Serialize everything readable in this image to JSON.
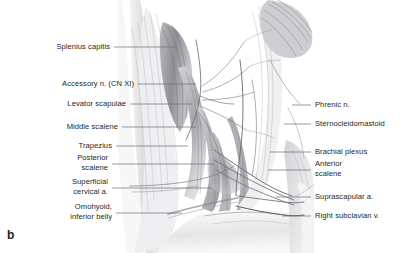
{
  "figure": {
    "marker": "b",
    "caption_text": "",
    "illustration": "grayscale-anatomical-drawing-lateral-cervical-region",
    "colors": {
      "background": "#ffffff",
      "text": "#231f20",
      "leader_line": "#6e6e72",
      "art_mid_gray": "#9a9a9e",
      "art_dark_gray": "#54545a",
      "art_light_gray": "#d5d5d8"
    }
  },
  "labels": {
    "left": [
      {
        "id": "splenius-capitis",
        "lines": [
          "Splenius capitis"
        ],
        "x": 110,
        "y": 42,
        "leader_from_x": 114,
        "leader_y": 47,
        "leader_to_x": 177
      },
      {
        "id": "accessory-nerve",
        "lines": [
          "Accessory n. (CN XI)"
        ],
        "x": 134,
        "y": 79,
        "leader_from_x": 138,
        "leader_y": 84,
        "leader_to_x": 196
      },
      {
        "id": "levator-scapulae",
        "lines": [
          "Levator scapulae"
        ],
        "x": 126,
        "y": 99,
        "leader_from_x": 130,
        "leader_y": 104,
        "leader_to_x": 192
      },
      {
        "id": "middle-scalene",
        "lines": [
          "Middle scalene"
        ],
        "x": 118,
        "y": 122,
        "leader_from_x": 122,
        "leader_y": 127,
        "leader_to_x": 196
      },
      {
        "id": "trapezius",
        "lines": [
          "Trapezius"
        ],
        "x": 112,
        "y": 141,
        "leader_from_x": 116,
        "leader_y": 146,
        "leader_to_x": 188
      },
      {
        "id": "posterior-scalene",
        "lines": [
          "Posterior",
          "scalene"
        ],
        "x": 108,
        "y": 153,
        "leader_from_x": 112,
        "leader_y": 164,
        "leader_to_x": 214
      },
      {
        "id": "superficial-cervical-artery",
        "lines": [
          "Superficial",
          "cervical a."
        ],
        "x": 108,
        "y": 177,
        "leader_from_x": 112,
        "leader_y": 188,
        "leader_to_x": 212
      },
      {
        "id": "omohyoid-inferior-belly",
        "lines": [
          "Omohyoid,",
          "inferior belly"
        ],
        "x": 112,
        "y": 202,
        "leader_from_x": 116,
        "leader_y": 213,
        "leader_to_x": 182
      }
    ],
    "right": [
      {
        "id": "phrenic-nerve",
        "lines": [
          "Phrenic n."
        ],
        "x": 315,
        "y": 100,
        "leader_from_x": 311,
        "leader_y": 105,
        "leader_to_x": 292
      },
      {
        "id": "sternocleidomastoid",
        "lines": [
          "Sternocleidomastoid"
        ],
        "x": 315,
        "y": 119,
        "leader_from_x": 311,
        "leader_y": 124,
        "leader_to_x": 284
      },
      {
        "id": "brachial-plexus",
        "lines": [
          "Brachial plexus"
        ],
        "x": 315,
        "y": 147,
        "leader_from_x": 311,
        "leader_y": 152,
        "leader_to_x": 270
      },
      {
        "id": "anterior-scalene",
        "lines": [
          "Anterior",
          "scalene"
        ],
        "x": 315,
        "y": 159,
        "leader_from_x": 311,
        "leader_y": 170,
        "leader_to_x": 268
      },
      {
        "id": "suprascapular-artery",
        "lines": [
          "Suprascapular a."
        ],
        "x": 315,
        "y": 192,
        "leader_from_x": 311,
        "leader_y": 197,
        "leader_to_x": 276
      },
      {
        "id": "right-subclavian-vein",
        "lines": [
          "Right subclavian v."
        ],
        "x": 315,
        "y": 211,
        "leader_from_x": 311,
        "leader_y": 216,
        "leader_to_x": 282
      }
    ]
  }
}
